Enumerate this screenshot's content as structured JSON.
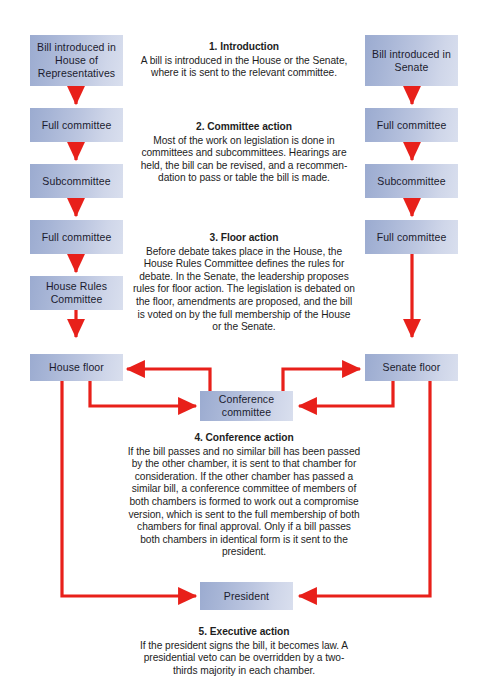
{
  "diagram": {
    "accent_color": "#e8201a",
    "node_fill_dark": "#9babd0",
    "node_fill_light": "#d9dfee",
    "text_color": "#1b1b2e"
  },
  "nodes": {
    "house_bill": "Bill introduced in House of Representatives",
    "house_full_committee_1": "Full committee",
    "house_subcommittee": "Subcommittee",
    "house_full_committee_2": "Full committee",
    "house_rules_committee": "House Rules Committee",
    "house_floor": "House floor",
    "senate_bill": "Bill introduced in Senate",
    "senate_full_committee_1": "Full committee",
    "senate_subcommittee": "Subcommittee",
    "senate_full_committee_2": "Full committee",
    "senate_floor": "Senate floor",
    "conference_committee": "Conference committee",
    "president": "President"
  },
  "steps": [
    {
      "heading": "1.  Introduction",
      "body": "A bill is introduced in the House or the Senate, where it is sent to the relevant committee."
    },
    {
      "heading": "2.  Committee action",
      "body": "Most of the work on legislation is done in committees and subcommittees. Hearings are held, the bill can be revised, and a recommen-dation to pass or table the bill is made."
    },
    {
      "heading": "3.  Floor action",
      "body": "Before debate takes place in the House, the House Rules Committee defines the rules for debate. In the Senate, the leadership proposes rules for floor action. The legislation is debated on the floor, amendments are proposed, and the bill is voted on by the full membership of the House or the Senate."
    },
    {
      "heading": "4.  Conference action",
      "body": "If the bill passes and no similar bill has been passed by the other chamber, it is sent to that chamber for consideration. If the other chamber has passed a similar bill, a conference committee of members of both chambers is formed to work out a compromise version, which is sent to the full membership of both chambers for final approval. Only if a bill passes both chambers in identical form is it sent to the president."
    },
    {
      "heading": "5.  Executive action",
      "body": "If the president signs the bill, it becomes law. A presidential veto can be overridden by a two-thirds majority in each chamber."
    }
  ]
}
